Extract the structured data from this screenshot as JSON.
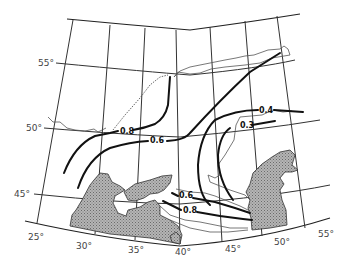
{
  "map": {
    "region": "Black Sea – Caspian Sea",
    "latitude_labels": [
      {
        "text": "55°",
        "x": 40,
        "y": 64
      },
      {
        "text": "50°",
        "x": 28,
        "y": 130
      },
      {
        "text": "45°",
        "x": 16,
        "y": 196
      }
    ],
    "longitude_labels": [
      {
        "text": "25°",
        "x": 30,
        "y": 240
      },
      {
        "text": "30°",
        "x": 77,
        "y": 248
      },
      {
        "text": "35°",
        "x": 130,
        "y": 252
      },
      {
        "text": "40°",
        "x": 178,
        "y": 254
      },
      {
        "text": "45°",
        "x": 228,
        "y": 251
      },
      {
        "text": "50°",
        "x": 276,
        "y": 245
      },
      {
        "text": "55°",
        "x": 320,
        "y": 237
      }
    ],
    "isolines": [
      {
        "value": "0.8",
        "label_x": 122,
        "label_y": 132
      },
      {
        "value": "0.6",
        "label_x": 153,
        "label_y": 141
      },
      {
        "value": "0.4",
        "label_x": 262,
        "label_y": 112
      },
      {
        "value": "0.3",
        "label_x": 241,
        "label_y": 127
      },
      {
        "value": "0.6",
        "label_x": 182,
        "label_y": 198
      },
      {
        "value": "0.8",
        "label_x": 186,
        "label_y": 213
      }
    ],
    "colors": {
      "sea_fill": "#9a9a9a",
      "isoline": "#111111",
      "grid": "#333333",
      "background": "#ffffff"
    }
  }
}
